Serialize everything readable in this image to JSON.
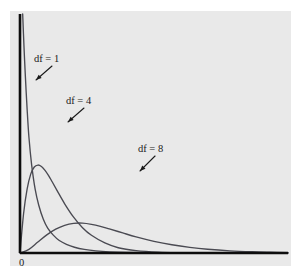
{
  "chart_data": {
    "type": "line",
    "title": "",
    "subtitle": "",
    "xlabel": "",
    "ylabel": "",
    "grid": false,
    "legend_position": "inline-annotations",
    "xlim": [
      0,
      30
    ],
    "ylim": [
      0,
      0.5
    ],
    "x_tick_labels": [
      "0"
    ],
    "y_tick_labels": [],
    "annotations": [
      {
        "id": "df1",
        "label": "df = 1",
        "text_x": 34,
        "text_y": 62,
        "arrow_from_x": 52,
        "arrow_from_y": 66,
        "arrow_to_x": 36,
        "arrow_to_y": 80
      },
      {
        "id": "df4",
        "label": "df = 4",
        "text_x": 66,
        "text_y": 104,
        "arrow_from_x": 84,
        "arrow_from_y": 108,
        "arrow_to_x": 68,
        "arrow_to_y": 122
      },
      {
        "id": "df8",
        "label": "df = 8",
        "text_x": 138,
        "text_y": 152,
        "arrow_from_x": 155,
        "arrow_from_y": 156,
        "arrow_to_x": 140,
        "arrow_to_y": 171
      }
    ],
    "series": [
      {
        "name": "df = 1",
        "degrees_of_freedom": 1,
        "color": "#4a4a52",
        "x": [
          0.3,
          0.45,
          0.6,
          0.8,
          1.0,
          1.3,
          1.7,
          2.1,
          2.6,
          3.1,
          3.7,
          4.4,
          5.2,
          6.1,
          7.2,
          8.5,
          10.0,
          12.0,
          14.5,
          17.5,
          21.0,
          25.0,
          30.0
        ],
        "y": [
          0.5,
          0.43,
          0.37,
          0.3,
          0.242,
          0.185,
          0.133,
          0.1,
          0.071,
          0.052,
          0.038,
          0.026,
          0.018,
          0.012,
          0.0075,
          0.0044,
          0.0024,
          0.0011,
          0.00045,
          0.00015,
          5e-05,
          2e-05,
          1e-05
        ]
      },
      {
        "name": "df = 4",
        "degrees_of_freedom": 4,
        "color": "#4a4a52",
        "x": [
          0.0,
          0.4,
          0.8,
          1.2,
          1.6,
          2.0,
          2.4,
          2.8,
          3.2,
          3.6,
          4.2,
          5.0,
          6.0,
          7.0,
          8.0,
          9.5,
          11.0,
          13.0,
          15.5,
          18.0,
          21.0,
          25.0,
          30.0
        ],
        "y": [
          0.0,
          0.082,
          0.134,
          0.165,
          0.18,
          0.184,
          0.181,
          0.173,
          0.162,
          0.149,
          0.129,
          0.103,
          0.075,
          0.053,
          0.037,
          0.021,
          0.011,
          0.005,
          0.0017,
          0.0006,
          0.0002,
          5e-05,
          1e-05
        ]
      },
      {
        "name": "df = 8",
        "degrees_of_freedom": 8,
        "color": "#4a4a52",
        "x": [
          0.0,
          1.0,
          2.0,
          3.0,
          4.0,
          5.0,
          6.0,
          7.0,
          8.0,
          9.0,
          10.0,
          11.5,
          13.0,
          15.0,
          17.0,
          19.0,
          21.0,
          23.5,
          26.0,
          28.0,
          30.0
        ],
        "y": [
          0.0,
          0.0077,
          0.023,
          0.038,
          0.05,
          0.058,
          0.062,
          0.0625,
          0.06,
          0.0558,
          0.0504,
          0.042,
          0.0338,
          0.0245,
          0.0172,
          0.0118,
          0.0079,
          0.0046,
          0.0026,
          0.0016,
          0.0009
        ]
      }
    ]
  },
  "axes": {
    "origin_label": "0",
    "axis_color": "#0d0d0d",
    "x_axis": {
      "x1": 20,
      "y1": 253,
      "x2": 288,
      "y2": 253
    },
    "y_axis": {
      "x1": 20,
      "y1": 14,
      "x2": 20,
      "y2": 253
    }
  },
  "panel": {
    "background_color": "#e9e9e9",
    "outer_background_color": "#ffffff"
  }
}
